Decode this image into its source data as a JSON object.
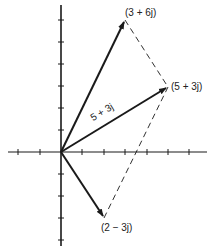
{
  "diagram": {
    "title": "",
    "origin_px": [
      61,
      152
    ],
    "unit_px": {
      "x": 21.5,
      "y": 22
    },
    "axes": {
      "x_ticks": [
        -2,
        -1,
        1,
        2,
        3,
        4,
        5,
        6
      ],
      "y_ticks": [
        6,
        5,
        4,
        3,
        2,
        1,
        -1,
        -2,
        -3,
        -4
      ]
    },
    "vectors": [
      {
        "name": "a",
        "label": "(3 + 6j)",
        "re": 3,
        "im": 6
      },
      {
        "name": "sum",
        "label": "(5 + 3j)",
        "re": 5,
        "im": 3
      },
      {
        "name": "b",
        "label": "(2 − 3j)",
        "re": 2,
        "im": -3
      }
    ],
    "sum_vector_inline_label": "5 + 3j",
    "dashed_lines": [
      {
        "from": [
          3,
          6
        ],
        "to": [
          5,
          3
        ]
      },
      {
        "from": [
          2,
          -3
        ],
        "to": [
          5,
          3
        ]
      }
    ],
    "colors": {
      "ink": "#1a1a1a",
      "background": "#ffffff"
    }
  }
}
